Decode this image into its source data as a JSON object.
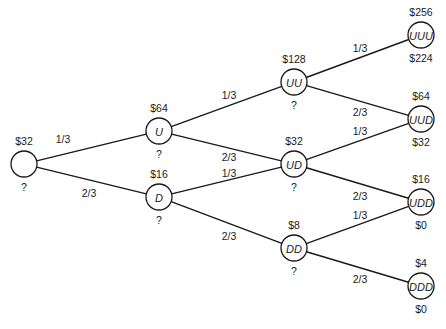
{
  "diagram": {
    "type": "binomial-tree",
    "nodes": [
      {
        "id": "root",
        "label": "",
        "value": "$32",
        "sub": "?",
        "x": 24,
        "y": 164
      },
      {
        "id": "U",
        "label": "U",
        "value": "$64",
        "sub": "?",
        "x": 159,
        "y": 131
      },
      {
        "id": "D",
        "label": "D",
        "value": "$16",
        "sub": "?",
        "x": 159,
        "y": 197
      },
      {
        "id": "UU",
        "label": "UU",
        "value": "$128",
        "sub": "?",
        "x": 294,
        "y": 82
      },
      {
        "id": "UD",
        "label": "UD",
        "value": "$32",
        "sub": "?",
        "x": 294,
        "y": 164
      },
      {
        "id": "DD",
        "label": "DD",
        "value": "$8",
        "sub": "?",
        "x": 294,
        "y": 248
      },
      {
        "id": "UUU",
        "label": "UUU",
        "value": "$256",
        "sub": "$224",
        "x": 421,
        "y": 35
      },
      {
        "id": "UUD",
        "label": "UUD",
        "value": "$64",
        "sub": "$32",
        "x": 421,
        "y": 119
      },
      {
        "id": "UDD",
        "label": "UDD",
        "value": "$16",
        "sub": "$0",
        "x": 421,
        "y": 202
      },
      {
        "id": "DDD",
        "label": "DDD",
        "value": "$4",
        "sub": "$0",
        "x": 421,
        "y": 286
      }
    ],
    "edges": [
      {
        "from": "root",
        "to": "U",
        "prob": "1/3",
        "lx": 63,
        "ly": 143
      },
      {
        "from": "root",
        "to": "D",
        "prob": "2/3",
        "lx": 89,
        "ly": 197
      },
      {
        "from": "U",
        "to": "UU",
        "prob": "1/3",
        "lx": 229,
        "ly": 99
      },
      {
        "from": "U",
        "to": "UD",
        "prob": "2/3",
        "lx": 229,
        "ly": 161
      },
      {
        "from": "D",
        "to": "UD",
        "prob": "1/3",
        "lx": 229,
        "ly": 177
      },
      {
        "from": "D",
        "to": "DD",
        "prob": "2/3",
        "lx": 229,
        "ly": 240
      },
      {
        "from": "UU",
        "to": "UUU",
        "prob": "1/3",
        "lx": 360,
        "ly": 52
      },
      {
        "from": "UU",
        "to": "UUD",
        "prob": "2/3",
        "lx": 360,
        "ly": 116
      },
      {
        "from": "UD",
        "to": "UUD",
        "prob": "1/3",
        "lx": 360,
        "ly": 135
      },
      {
        "from": "UD",
        "to": "UDD",
        "prob": "2/3",
        "lx": 360,
        "ly": 200
      },
      {
        "from": "DD",
        "to": "UDD",
        "prob": "1/3",
        "lx": 360,
        "ly": 219
      },
      {
        "from": "DD",
        "to": "DDD",
        "prob": "2/3",
        "lx": 360,
        "ly": 283
      }
    ]
  }
}
